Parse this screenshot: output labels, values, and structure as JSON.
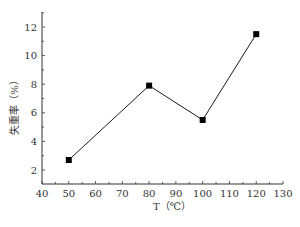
{
  "chart_data": {
    "type": "line",
    "title": "",
    "xlabel": "T（℃）",
    "ylabel": "失重率（%）",
    "x": [
      50,
      80,
      100,
      120
    ],
    "series": [
      {
        "name": "失重率",
        "values": [
          2.7,
          7.9,
          5.5,
          11.5
        ],
        "marker": "square",
        "color": "#000000"
      }
    ],
    "xlim": [
      40,
      130
    ],
    "ylim": [
      1,
      13
    ],
    "xticks": [
      40,
      50,
      60,
      70,
      80,
      90,
      100,
      110,
      120,
      130
    ],
    "yticks": [
      2,
      4,
      6,
      8,
      10,
      12
    ],
    "grid": false,
    "legend": null
  }
}
